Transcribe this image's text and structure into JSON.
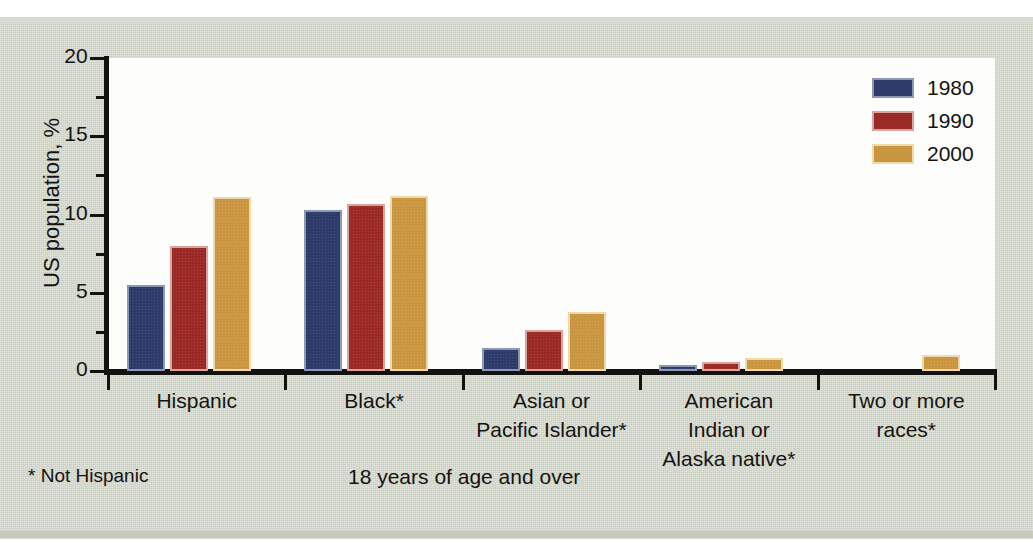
{
  "chart_data": {
    "type": "bar",
    "title": "",
    "subtitle": "",
    "xlabel": "",
    "ylabel": "US population, %",
    "ylim": [
      0,
      20
    ],
    "y_ticks": [
      0,
      5,
      10,
      15,
      20
    ],
    "y_tick_labels": [
      "0",
      "5",
      "10",
      "15",
      "20"
    ],
    "y_minor_ticks": [
      2.5,
      7.5,
      12.5,
      17.5
    ],
    "grid": false,
    "legend_position": "top-right",
    "categories": [
      "Hispanic",
      "Black*",
      "Asian or Pacific Islander*",
      "American Indian or Alaska native*",
      "Two or more races*"
    ],
    "category_label_lines": [
      [
        "Hispanic"
      ],
      [
        "Black*"
      ],
      [
        "Asian or",
        "Pacific Islander*"
      ],
      [
        "American",
        "Indian or",
        "Alaska native*"
      ],
      [
        "Two or more",
        "races*"
      ]
    ],
    "series": [
      {
        "name": "1980",
        "color": "#2c3b69",
        "values": [
          5.5,
          10.3,
          1.5,
          0.4,
          null
        ]
      },
      {
        "name": "1990",
        "color": "#9b2a26",
        "values": [
          8.0,
          10.7,
          2.6,
          0.6,
          null
        ]
      },
      {
        "name": "2000",
        "color": "#c9953f",
        "values": [
          11.1,
          11.2,
          3.8,
          0.8,
          1.0
        ]
      }
    ],
    "annotations": [
      "* Not Hispanic",
      "18 years of age and over"
    ]
  },
  "legend": {
    "entries": [
      {
        "label": "1980",
        "color": "#2c3b69"
      },
      {
        "label": "1990",
        "color": "#9b2a26"
      },
      {
        "label": "2000",
        "color": "#c9953f"
      }
    ]
  },
  "footnotes": {
    "left": "* Not Hispanic",
    "center": "18 years of age and over"
  },
  "colors": {
    "paper": "#ccd0c3",
    "plot_background": "#fdfdfb",
    "axis": "#14120f",
    "text": "#151310",
    "series_1980": "#2c3b69",
    "series_1990": "#9b2a26",
    "series_2000": "#c9953f"
  }
}
